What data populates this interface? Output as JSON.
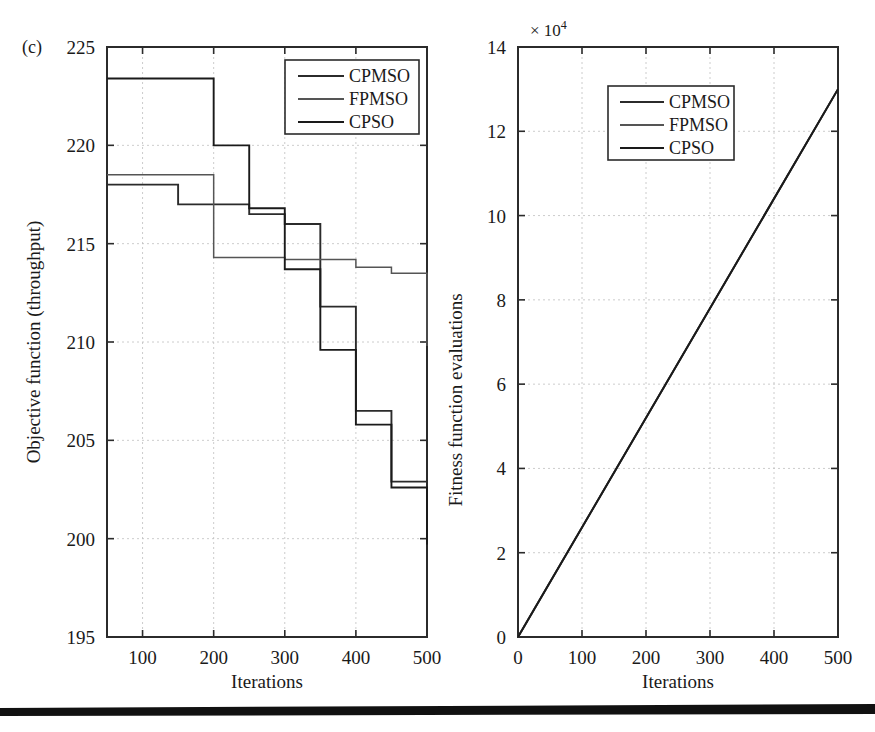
{
  "figure": {
    "panel_label": "(c)",
    "background": "#ffffff",
    "line_color": "#2b2b2b",
    "grid_color": "#bfbfbf",
    "rule_color": "#111111"
  },
  "chart_data": [
    {
      "type": "line",
      "id": "objective-function-chart",
      "panel": "(c)",
      "title": "",
      "xlabel": "Iterations",
      "ylabel": "Objective function (throughput)",
      "xlim": [
        50,
        500
      ],
      "ylim": [
        195,
        225
      ],
      "xticks": [
        100,
        200,
        300,
        400,
        500
      ],
      "yticks": [
        195,
        200,
        205,
        210,
        215,
        220,
        225
      ],
      "grid": true,
      "drawstyle": "steps-post",
      "legend": [
        "CPMSO",
        "FPMSO",
        "CPSO"
      ],
      "legend_position": "upper right",
      "x": [
        50,
        100,
        150,
        200,
        250,
        300,
        350,
        400,
        450,
        500
      ],
      "series": [
        {
          "name": "CPMSO",
          "color": "#2b2b2b",
          "values": [
            218.0,
            218.0,
            217.0,
            217.0,
            216.5,
            216.0,
            211.8,
            206.5,
            202.9,
            200.8
          ]
        },
        {
          "name": "FPMSO",
          "color": "#555555",
          "values": [
            218.5,
            218.5,
            218.5,
            214.3,
            214.3,
            214.2,
            214.2,
            213.8,
            213.5,
            209.8
          ]
        },
        {
          "name": "CPSO",
          "color": "#1a1a1a",
          "values": [
            223.4,
            223.4,
            223.4,
            220.0,
            216.8,
            213.7,
            209.6,
            205.8,
            202.6,
            199.7
          ]
        }
      ]
    },
    {
      "type": "line",
      "id": "fitness-evaluations-chart",
      "title": "",
      "xlabel": "Iterations",
      "ylabel": "Fitness function evaluations",
      "y_multiplier": "× 10",
      "y_multiplier_exponent": "4",
      "xlim": [
        0,
        500
      ],
      "ylim": [
        0,
        14
      ],
      "xticks": [
        0,
        100,
        200,
        300,
        400,
        500
      ],
      "yticks": [
        0,
        2,
        4,
        6,
        8,
        10,
        12,
        14
      ],
      "grid": true,
      "drawstyle": "line",
      "legend": [
        "CPMSO",
        "FPMSO",
        "CPSO"
      ],
      "legend_position": "upper center",
      "x": [
        0,
        500
      ],
      "series": [
        {
          "name": "CPMSO",
          "color": "#2b2b2b",
          "values": [
            0,
            13.0
          ]
        },
        {
          "name": "FPMSO",
          "color": "#555555",
          "values": [
            0,
            13.0
          ]
        },
        {
          "name": "CPSO",
          "color": "#1a1a1a",
          "values": [
            0,
            13.0
          ]
        }
      ]
    }
  ]
}
